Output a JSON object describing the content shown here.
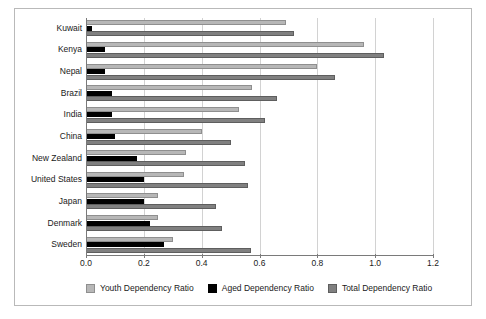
{
  "chart_data": {
    "type": "bar",
    "orientation": "horizontal",
    "title": "",
    "xlabel": "",
    "ylabel": "",
    "xlim": [
      0.0,
      1.2
    ],
    "xticks": [
      "0.0",
      "0.2",
      "0.4",
      "0.6",
      "0.8",
      "1.0",
      "1.2"
    ],
    "xtick_values": [
      0.0,
      0.2,
      0.4,
      0.6,
      0.8,
      1.0,
      1.2
    ],
    "grid": true,
    "grid_axis": "x",
    "legend_position": "bottom",
    "categories": [
      "Kuwait",
      "Kenya",
      "Nepal",
      "Brazil",
      "India",
      "China",
      "New Zealand",
      "United States",
      "Japan",
      "Denmark",
      "Sweden"
    ],
    "series": [
      {
        "name": "Youth Dependency Ratio",
        "color": "#b7b7b7",
        "values": [
          0.69,
          0.96,
          0.8,
          0.575,
          0.53,
          0.4,
          0.345,
          0.34,
          0.25,
          0.25,
          0.3
        ]
      },
      {
        "name": "Aged Dependency Ratio",
        "color": "#000000",
        "values": [
          0.02,
          0.065,
          0.065,
          0.09,
          0.09,
          0.1,
          0.175,
          0.2,
          0.2,
          0.22,
          0.27
        ]
      },
      {
        "name": "Total Dependency Ratio",
        "color": "#808080",
        "values": [
          0.72,
          1.03,
          0.86,
          0.66,
          0.62,
          0.5,
          0.55,
          0.56,
          0.45,
          0.47,
          0.57
        ]
      }
    ]
  },
  "legend": {
    "items": [
      {
        "label": "Youth Dependency Ratio",
        "swatch": "youth"
      },
      {
        "label": "Aged Dependency Ratio",
        "swatch": "aged"
      },
      {
        "label": "Total Dependency Ratio",
        "swatch": "total"
      }
    ]
  }
}
